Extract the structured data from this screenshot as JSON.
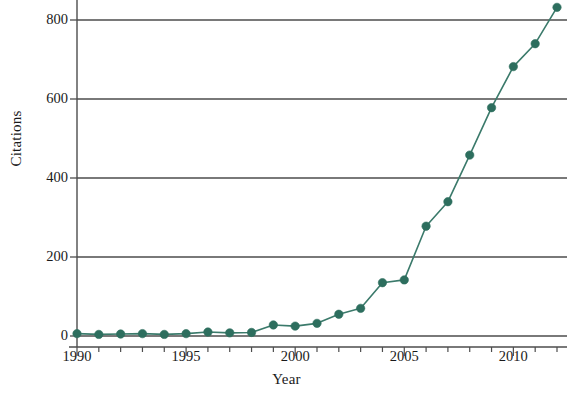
{
  "chart_data": {
    "type": "line",
    "title": "",
    "xlabel": "Year",
    "ylabel": "Citations",
    "x": [
      1990,
      1991,
      1992,
      1993,
      1994,
      1995,
      1996,
      1997,
      1998,
      1999,
      2000,
      2001,
      2002,
      2003,
      2004,
      2005,
      2006,
      2007,
      2008,
      2009,
      2010,
      2011,
      2012
    ],
    "values": [
      6,
      4,
      5,
      6,
      4,
      6,
      10,
      8,
      9,
      28,
      25,
      32,
      55,
      70,
      135,
      142,
      278,
      340,
      458,
      578,
      682,
      740,
      832
    ],
    "series": [
      {
        "name": "Citations",
        "values": [
          6,
          4,
          5,
          6,
          4,
          6,
          10,
          8,
          9,
          28,
          25,
          32,
          55,
          70,
          135,
          142,
          278,
          340,
          458,
          578,
          682,
          740,
          832
        ]
      }
    ],
    "xlim": [
      1989.5,
      2012.4
    ],
    "ylim": [
      0,
      845
    ],
    "xticks": [
      1990,
      1995,
      2000,
      2005,
      2010
    ],
    "xtick_labels": [
      "1990",
      "1995",
      "2000",
      "2005",
      "2010"
    ],
    "xminor_ticks": [
      1990,
      1991,
      1992,
      1993,
      1994,
      1995,
      1996,
      1997,
      1998,
      1999,
      2000,
      2001,
      2002,
      2003,
      2004,
      2005,
      2006,
      2007,
      2008,
      2009,
      2010,
      2011,
      2012
    ],
    "yticks": [
      0,
      200,
      400,
      600,
      800
    ],
    "ytick_labels": [
      "0",
      "200",
      "400",
      "600",
      "800"
    ],
    "grid": "horizontal",
    "legend": "none",
    "marker": "circle",
    "colors": {
      "line": "#3b7a6b",
      "marker": "#2d6e5e",
      "grid": "#4d4d4d",
      "axis": "#4d4d4d",
      "text": "#1a1a1a",
      "background": "#ffffff"
    }
  },
  "axes": {
    "y_title": "Citations",
    "x_title": "Year"
  }
}
